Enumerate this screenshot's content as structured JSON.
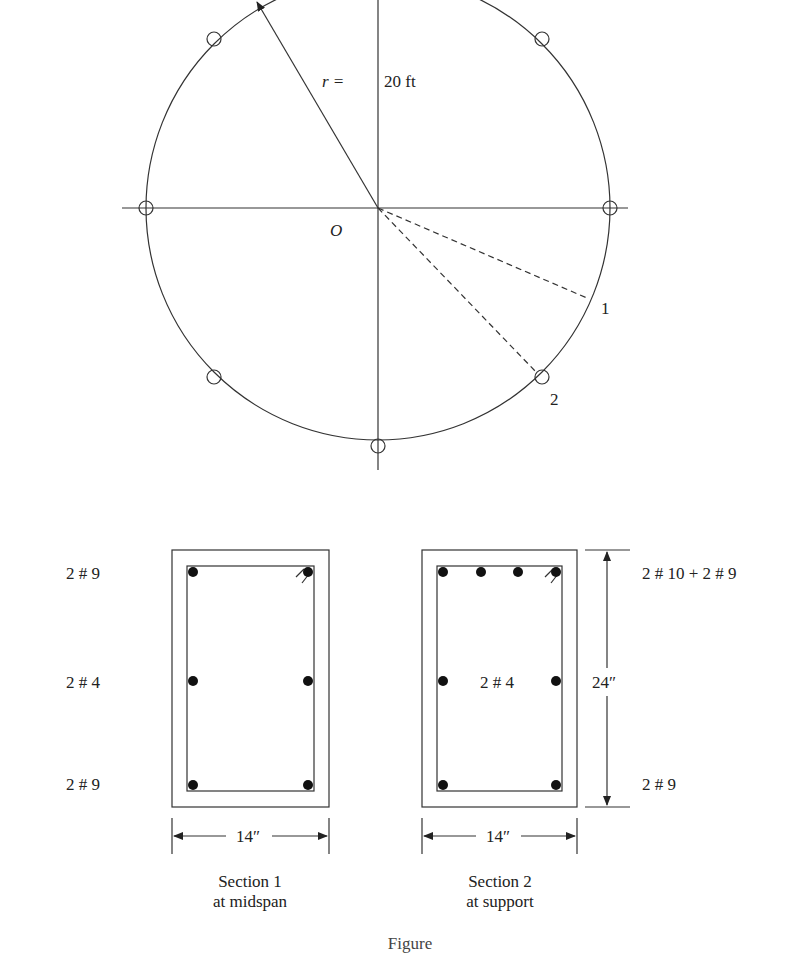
{
  "plan": {
    "radius_label_prefix": "r =",
    "radius_label_value": "20 ft",
    "center_label": "O",
    "section_markers": [
      "1",
      "2"
    ]
  },
  "sections": [
    {
      "title": "Section 1",
      "subtitle": "at midspan",
      "width_label": "14″",
      "top_bars": "2 # 9",
      "side_bars": "2 # 4",
      "bottom_bars": "2 # 9"
    },
    {
      "title": "Section 2",
      "subtitle": "at support",
      "width_label": "14″",
      "height_label": "24″",
      "top_bars": "2 # 10 + 2 # 9",
      "side_bars": "2 # 4",
      "bottom_bars": "2 # 9"
    }
  ],
  "figure_caption": "Figure"
}
